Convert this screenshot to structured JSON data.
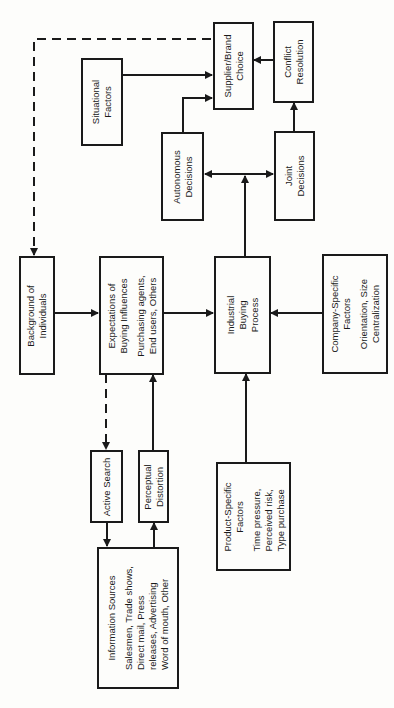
{
  "diagram": {
    "orientation": "rotated-90",
    "nodes": {
      "supplier_choice": {
        "lines": [
          "Supplier/Brand",
          "Choice"
        ]
      },
      "conflict_resolution": {
        "lines": [
          "Conflict",
          "Resolution"
        ]
      },
      "situational_factors": {
        "lines": [
          "Situational",
          "Factors"
        ]
      },
      "autonomous_decisions": {
        "lines": [
          "Autonomous",
          "Decisions"
        ]
      },
      "joint_decisions": {
        "lines": [
          "Joint",
          "Decisions"
        ]
      },
      "background": {
        "lines": [
          "Background of",
          "Individuals"
        ]
      },
      "expectations": {
        "lines": [
          "Expectations of",
          "Buying Influences",
          "Purchasing agents,",
          "End users, Others"
        ]
      },
      "industrial_buying": {
        "lines": [
          "Industrial",
          "Buying",
          "Process"
        ]
      },
      "company_specific": {
        "lines": [
          "Company-Specific",
          "Factors",
          "Orientation, Size",
          "Centralization"
        ]
      },
      "active_search": {
        "lines": [
          "Active Search"
        ]
      },
      "perceptual_distortion": {
        "lines": [
          "Perceptual",
          "Distortion"
        ]
      },
      "information_sources": {
        "lines": [
          "Information Sources",
          "Salesmen, Trade shows,",
          "Direct mail, Press",
          "releases, Advertising",
          "Word of mouth, Other"
        ]
      },
      "product_specific": {
        "lines": [
          "Product-Specific",
          "Factors",
          "Time pressure,",
          "Perceived risk,",
          "Type purchase"
        ]
      }
    },
    "edges": [
      {
        "from": "situational_factors",
        "to": "supplier_choice",
        "style": "solid"
      },
      {
        "from": "autonomous_decisions",
        "to": "supplier_choice",
        "style": "solid"
      },
      {
        "from": "conflict_resolution",
        "to": "supplier_choice",
        "style": "solid"
      },
      {
        "from": "joint_decisions",
        "to": "conflict_resolution",
        "style": "solid"
      },
      {
        "from": "industrial_buying",
        "to": "autonomous_decisions",
        "style": "solid"
      },
      {
        "from": "industrial_buying",
        "to": "joint_decisions",
        "style": "solid"
      },
      {
        "from": "supplier_choice",
        "to": "background",
        "style": "dashed"
      },
      {
        "from": "background",
        "to": "expectations",
        "style": "solid"
      },
      {
        "from": "expectations",
        "to": "industrial_buying",
        "style": "solid"
      },
      {
        "from": "company_specific",
        "to": "industrial_buying",
        "style": "solid"
      },
      {
        "from": "product_specific",
        "to": "industrial_buying",
        "style": "solid"
      },
      {
        "from": "expectations",
        "to": "active_search",
        "style": "dashed"
      },
      {
        "from": "active_search",
        "to": "information_sources",
        "style": "solid"
      },
      {
        "from": "information_sources",
        "to": "perceptual_distortion",
        "style": "solid"
      },
      {
        "from": "perceptual_distortion",
        "to": "expectations",
        "style": "solid"
      }
    ]
  }
}
